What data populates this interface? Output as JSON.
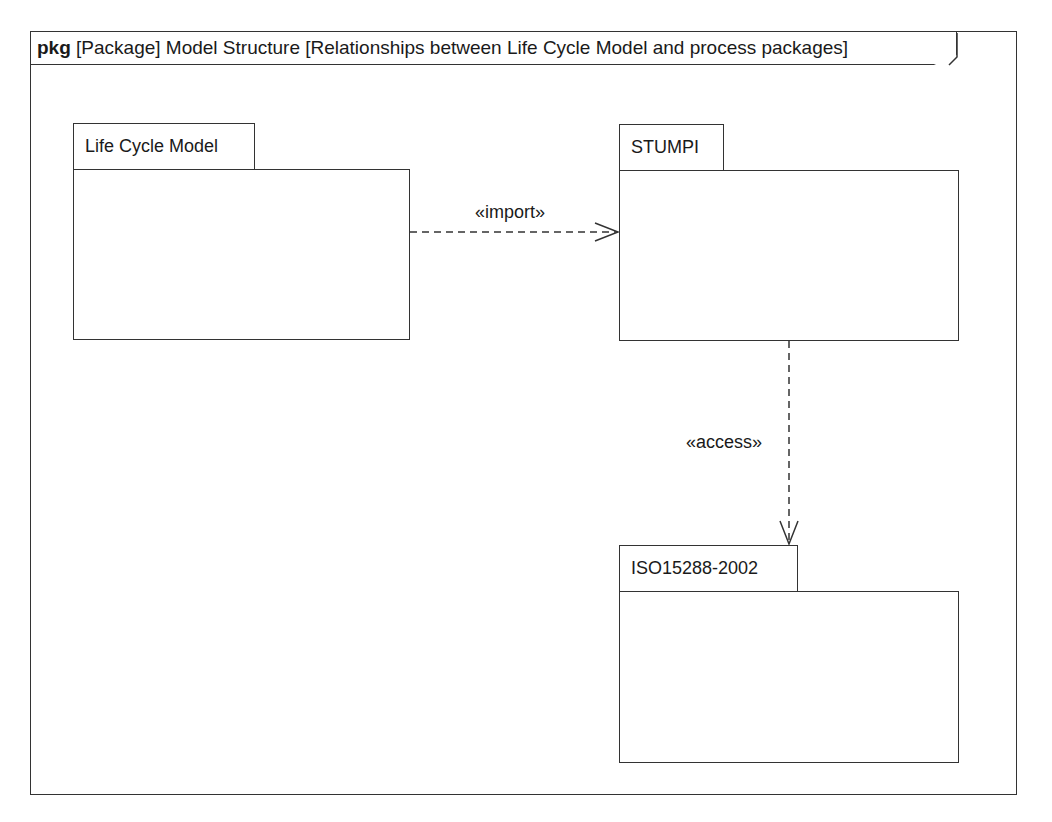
{
  "diagram": {
    "frame": {
      "kind": "pkg",
      "title": "[Package] Model Structure [Relationships between Life Cycle Model and process packages]"
    },
    "packages": [
      {
        "name": "Life Cycle Model"
      },
      {
        "name": "STUMPI"
      },
      {
        "name": "ISO15288-2002"
      }
    ],
    "relationships": [
      {
        "stereotype": "«import»",
        "from": "Life Cycle Model",
        "to": "STUMPI"
      },
      {
        "stereotype": "«access»",
        "from": "STUMPI",
        "to": "ISO15288-2002"
      }
    ]
  }
}
